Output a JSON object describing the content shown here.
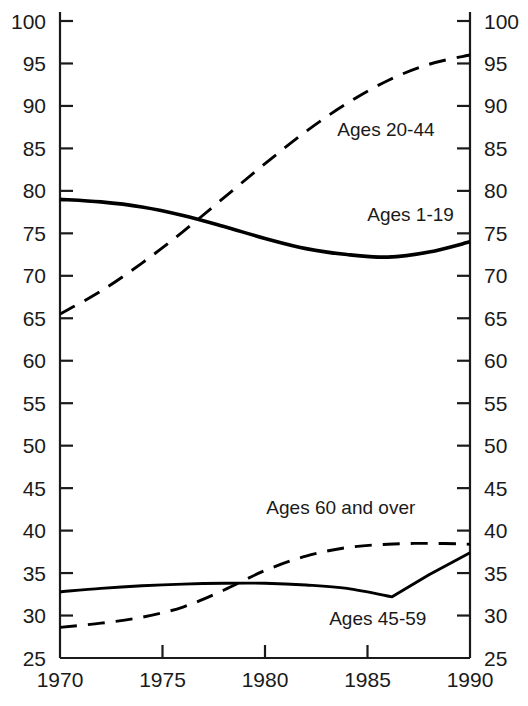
{
  "chart_data": {
    "type": "line",
    "title": "",
    "subtitle": "",
    "xlabel": "",
    "ylabel": "",
    "xlim": [
      1970,
      1990
    ],
    "ylim": [
      25,
      100
    ],
    "grid": false,
    "legend_position": "inline-annotations",
    "x_ticks": [
      1970,
      1975,
      1980,
      1985,
      1990
    ],
    "x_tick_labels": [
      "1970",
      "1975",
      "1980",
      "1985",
      "1990"
    ],
    "y_ticks": [
      25,
      30,
      35,
      40,
      45,
      50,
      55,
      60,
      65,
      70,
      75,
      80,
      85,
      90,
      95,
      100
    ],
    "y_tick_labels": [
      "25",
      "30",
      "35",
      "40",
      "45",
      "50",
      "55",
      "60",
      "65",
      "70",
      "75",
      "80",
      "85",
      "90",
      "95",
      "100"
    ],
    "y_axis_left": true,
    "y_axis_right": true,
    "series": [
      {
        "name": "Ages 1-19",
        "style": "solid",
        "color": "#000000",
        "label_text": "Ages 1-19",
        "x": [
          1970,
          1972,
          1974,
          1976,
          1978,
          1980,
          1982,
          1984,
          1986,
          1988,
          1990
        ],
        "values": [
          79.0,
          78.7,
          78.1,
          77.1,
          75.8,
          74.4,
          73.2,
          72.5,
          72.2,
          72.8,
          74.0
        ]
      },
      {
        "name": "Ages 20-44",
        "style": "dashed",
        "color": "#000000",
        "label_text": "Ages 20-44",
        "x": [
          1970,
          1972,
          1974,
          1976,
          1978,
          1980,
          1982,
          1984,
          1986,
          1988,
          1990
        ],
        "values": [
          65.5,
          68.2,
          71.5,
          75.2,
          79.2,
          83.2,
          87.0,
          90.3,
          93.0,
          94.9,
          96.0
        ]
      },
      {
        "name": "Ages 45-59",
        "style": "solid",
        "color": "#000000",
        "label_text": "Ages 45-59",
        "x": [
          1970,
          1972,
          1974,
          1976,
          1978,
          1980,
          1982,
          1984,
          1986.2,
          1988,
          1990
        ],
        "values": [
          32.8,
          33.2,
          33.5,
          33.7,
          33.8,
          33.8,
          33.6,
          33.2,
          32.2,
          34.8,
          37.4
        ]
      },
      {
        "name": "Ages 60 and over",
        "style": "dashed",
        "color": "#000000",
        "label_text": "Ages 60 and over",
        "x": [
          1970,
          1972,
          1974,
          1976,
          1978,
          1980,
          1982,
          1984,
          1986,
          1988,
          1990
        ],
        "values": [
          28.6,
          29.1,
          29.8,
          31.0,
          33.0,
          35.3,
          37.0,
          38.0,
          38.4,
          38.5,
          38.4
        ]
      }
    ],
    "annotations": [
      {
        "text": "Ages 20-44",
        "x": 1985.9,
        "y": 86.5
      },
      {
        "text": "Ages 1-19",
        "x": 1987.1,
        "y": 76.4
      },
      {
        "text": "Ages 60 and over",
        "x": 1983.7,
        "y": 42.0
      },
      {
        "text": "Ages 45-59",
        "x": 1985.5,
        "y": 28.9
      }
    ]
  },
  "colors": {
    "axis": "#1a1a1a",
    "line": "#000000",
    "background": "#ffffff",
    "text": "#1a1a1a"
  }
}
